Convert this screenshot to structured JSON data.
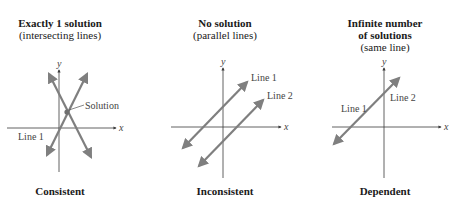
{
  "colors": {
    "line": "#7f7f7f",
    "axis": "#3a3a3a",
    "text": "#1a1a1a"
  },
  "panels": [
    {
      "title": "Exactly 1 solution",
      "subtitle": "(intersecting lines)",
      "caption": "Consistent",
      "axis_labels": {
        "x": "x",
        "y": "y"
      },
      "line_labels": [
        "Line 1"
      ],
      "annotation": "Solution"
    },
    {
      "title": "No solution",
      "subtitle": "(parallel lines)",
      "caption": "Inconsistent",
      "axis_labels": {
        "x": "x",
        "y": "y"
      },
      "line_labels": [
        "Line 1",
        "Line 2"
      ]
    },
    {
      "title": "Infinite number",
      "title2": "of solutions",
      "subtitle": "(same line)",
      "caption": "Dependent",
      "axis_labels": {
        "x": "x",
        "y": "y"
      },
      "line_labels": [
        "Line 1",
        "Line 2"
      ]
    }
  ]
}
